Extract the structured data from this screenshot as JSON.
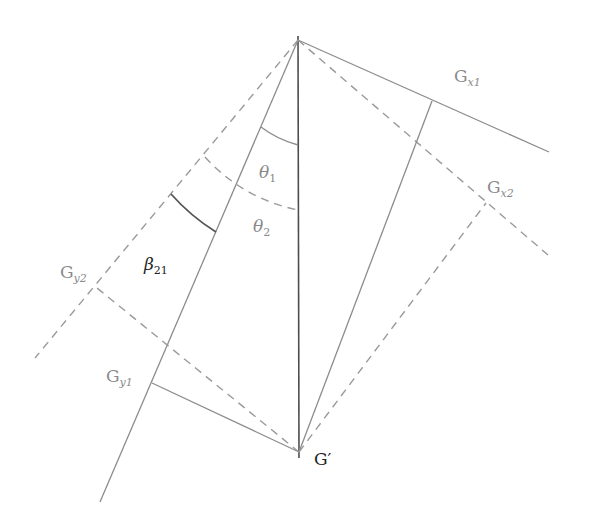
{
  "diagram": {
    "type": "geometry",
    "points": {
      "apex": {
        "x": 298,
        "y": 40
      },
      "G_prime": {
        "x": 299,
        "y": 452
      },
      "Gx1": {
        "x": 432,
        "y": 101
      },
      "Gx2": {
        "x": 486,
        "y": 203
      },
      "Gy1": {
        "x": 152,
        "y": 383
      },
      "Gy2": {
        "x": 97,
        "y": 288
      }
    },
    "labels": {
      "gx1": {
        "main": "G",
        "sub": "x1"
      },
      "gx2": {
        "main": "G",
        "sub": "x2"
      },
      "gy1": {
        "main": "G",
        "sub": "y1"
      },
      "gy2": {
        "main": "G",
        "sub": "y2"
      },
      "theta1": {
        "main": "θ",
        "sub": "1"
      },
      "theta2": {
        "main": "θ",
        "sub": "2"
      },
      "beta21": {
        "main": "β",
        "sub": "21"
      },
      "g_prime": "G′"
    },
    "colors": {
      "axis": "#4d4d4d",
      "lines": "#8c8c8c",
      "dashed": "#9a9a9a",
      "label": "#8a8a8a",
      "label_dark": "#222222"
    }
  }
}
